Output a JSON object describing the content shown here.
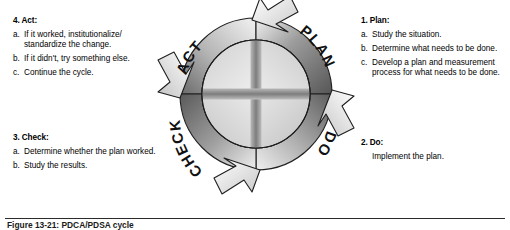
{
  "figure": {
    "caption": "Figure 13-21:  PDCA/PDSA cycle",
    "alt_title": "PDCA cycle diagram"
  },
  "wheel": {
    "labels": {
      "act": "ACT",
      "plan": "PLAN",
      "do": "DO",
      "check": "CHECK"
    },
    "colors": {
      "ring_dark": "#5e5e5e",
      "ring_mid": "#9a9a9a",
      "ring_light": "#e8e8e8",
      "inner_light": "#d8d8d8",
      "inner_cross": "#8c8c8c",
      "outline": "#1c1c1c",
      "arrow_light": "#f4f4f4",
      "label_text": "#111111"
    }
  },
  "sections": {
    "act": {
      "title": "4. Act:",
      "items": [
        {
          "marker": "a.",
          "text": "If it worked, institutionalize/ standardize the change."
        },
        {
          "marker": "b.",
          "text": "If it didn't, try something else."
        },
        {
          "marker": "c.",
          "text": "Continue the cycle."
        }
      ]
    },
    "check": {
      "title": "3. Check:",
      "items": [
        {
          "marker": "a.",
          "text": "Determine whether the plan worked."
        },
        {
          "marker": "b.",
          "text": "Study the results."
        }
      ]
    },
    "plan": {
      "title": "1. Plan:",
      "items": [
        {
          "marker": "a.",
          "text": "Study the situation."
        },
        {
          "marker": "b.",
          "text": "Determine what needs to be done."
        },
        {
          "marker": "c.",
          "text": "Develop a plan and measurement process for what needs to be done."
        }
      ]
    },
    "do": {
      "title": "2. Do:",
      "body": "Implement the plan."
    }
  }
}
